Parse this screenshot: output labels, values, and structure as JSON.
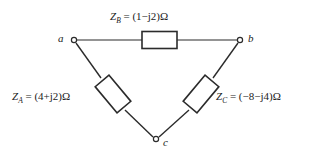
{
  "figure": {
    "type": "delta-impedance-network",
    "background_color": "#ffffff",
    "line_color": "#2b2b2b"
  },
  "nodes": [
    {
      "id": "a",
      "label": "a",
      "x": 74,
      "y": 40
    },
    {
      "id": "b",
      "label": "b",
      "x": 240,
      "y": 40
    },
    {
      "id": "c",
      "label": "c",
      "x": 156,
      "y": 139
    }
  ],
  "impedances": [
    {
      "id": "ZB",
      "symbol": "Z",
      "subscript": "B",
      "equals": "=",
      "value": "(1−j2)Ω",
      "between": "a-b",
      "real": 1,
      "imag": -2,
      "unit": "Ω"
    },
    {
      "id": "ZA",
      "symbol": "Z",
      "subscript": "A",
      "equals": "=",
      "value": "(4+j2)Ω",
      "between": "a-c",
      "real": 4,
      "imag": 2,
      "unit": "Ω"
    },
    {
      "id": "ZC",
      "symbol": "Z",
      "subscript": "C",
      "equals": "=",
      "value": "(−8−j4)Ω",
      "between": "b-c",
      "real": -8,
      "imag": -4,
      "unit": "Ω"
    }
  ]
}
